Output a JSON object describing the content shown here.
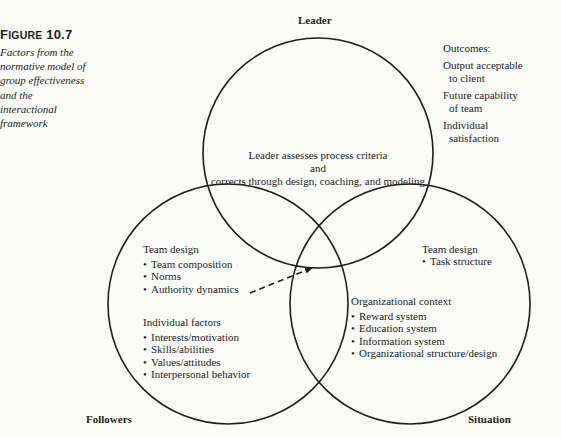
{
  "figure": {
    "number_prefix": "F",
    "number_rest": "IGURE",
    "number_value": "10.7",
    "caption_lines": [
      "Factors from the",
      "normative model of",
      "group effectiveness",
      "and the",
      "interactional",
      "framework"
    ]
  },
  "circles": {
    "leader": {
      "label": "Leader",
      "center_text_line1": "Leader assesses process criteria",
      "center_text_line2": "and",
      "center_text_line3": "corrects through design, coaching, and modeling"
    },
    "followers": {
      "label": "Followers",
      "team_design_heading": "Team design",
      "team_design_items": [
        "Team composition",
        "Norms",
        "Authority dynamics"
      ],
      "individual_heading": "Individual factors",
      "individual_items": [
        "Interests/motivation",
        "Skills/abilities",
        "Values/attitudes",
        "Interpersonal behavior"
      ]
    },
    "situation": {
      "label": "Situation",
      "team_design_heading": "Team design",
      "team_design_items": [
        "Task structure"
      ],
      "org_heading": "Organizational context",
      "org_items": [
        "Reward system",
        "Education system",
        "Information system",
        "Organizational structure/design"
      ]
    }
  },
  "outcomes": {
    "heading": "Outcomes:",
    "items": [
      {
        "line1": "Output acceptable",
        "line2": "to client"
      },
      {
        "line1": "Future capability",
        "line2": "of team"
      },
      {
        "line1": "Individual",
        "line2": "satisfaction"
      }
    ]
  },
  "colors": {
    "stroke": "#1e1e1e",
    "background": "#fbfbfa"
  }
}
